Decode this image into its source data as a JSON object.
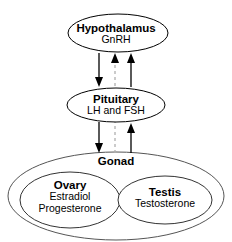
{
  "diagram": {
    "background_color": "#ffffff",
    "stroke_color": "#000000",
    "dashed_stroke_color": "#b0b0b0",
    "nodes": {
      "hypothalamus": {
        "name": "Hypothalamus",
        "hormone": "GnRH"
      },
      "pituitary": {
        "name": "Pituitary",
        "hormones": "LH and FSH"
      },
      "gonad": {
        "name": "Gonad"
      },
      "ovary": {
        "name": "Ovary",
        "hormone_1": "Estradiol",
        "hormone_2": "Progesterone"
      },
      "testis": {
        "name": "Testis",
        "hormone": "Testosterone"
      }
    },
    "connections": [
      {
        "id": "hypothalamus-to-pituitary",
        "from": "Hypothalamus",
        "to": "Pituitary",
        "direction": "down",
        "style": "solid"
      },
      {
        "id": "pituitary-to-hypothalamus-dashed",
        "from": "Pituitary",
        "to": "Hypothalamus",
        "direction": "up",
        "style": "dashed"
      },
      {
        "id": "pituitary-to-hypothalamus-solid",
        "from": "Pituitary",
        "to": "Hypothalamus",
        "direction": "up",
        "style": "solid"
      },
      {
        "id": "pituitary-to-gonad",
        "from": "Pituitary",
        "to": "Gonad",
        "direction": "down",
        "style": "solid"
      },
      {
        "id": "gonad-to-hypothalamus-dashed",
        "from": "Gonad",
        "to": "Hypothalamus",
        "direction": "up",
        "style": "dashed"
      },
      {
        "id": "gonad-to-pituitary-solid",
        "from": "Gonad",
        "to": "Pituitary",
        "direction": "up",
        "style": "solid"
      }
    ]
  }
}
